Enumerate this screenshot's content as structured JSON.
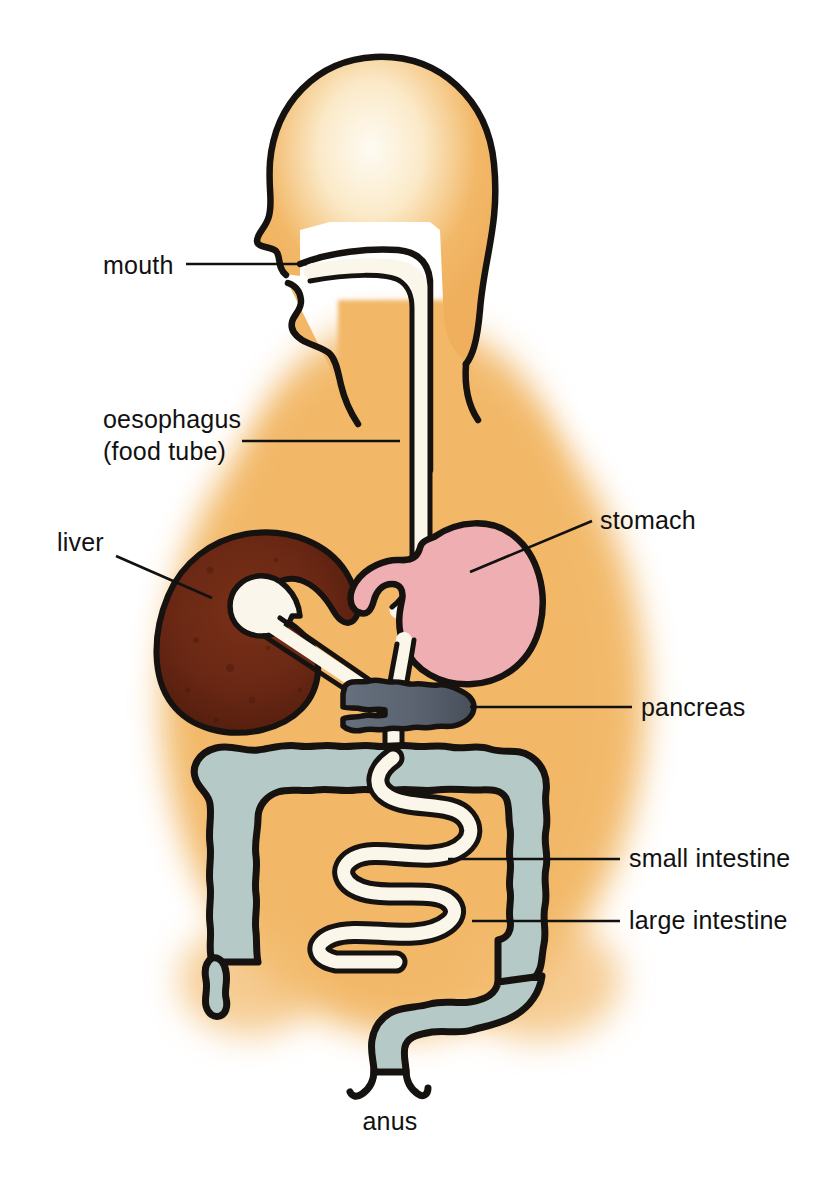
{
  "figure": {
    "background_color": "#ffffff"
  },
  "colors": {
    "body_fill": "#F2B868",
    "body_fill_edge": "#F6C77E",
    "head_highlight": "#FBF3E4",
    "outline": "#16120f",
    "liver": "#6E2A16",
    "liver_dark": "#54200f",
    "gallbladder": "#FBF6EC",
    "stomach": "#EFAEB1",
    "pancreas": "#5D6674",
    "pancreas_dark": "#4A525E",
    "large_intestine": "#B5CAC6",
    "small_intestine": "#FBF6EA",
    "tube": "#FBF6EA",
    "label_text": "#111111",
    "leader_line": "#111111"
  },
  "labels": [
    {
      "id": "mouth",
      "text": "mouth",
      "text_x": 103,
      "text_y": 274,
      "anchor": "start",
      "leader": "M 186 264 L 307 264",
      "side": "left"
    },
    {
      "id": "oesophagus",
      "text": "oesophagus",
      "text_x": 103,
      "text_y": 428,
      "anchor": "start",
      "line2": "(food tube)",
      "line2_x": 103,
      "line2_y": 460,
      "leader": "M 242 441 L 392 441",
      "side": "left"
    },
    {
      "id": "liver",
      "text": "liver",
      "text_x": 57,
      "text_y": 551,
      "anchor": "start",
      "leader": "M 116 556 L 210 596",
      "side": "left"
    },
    {
      "id": "stomach",
      "text": "stomach",
      "text_x": 600,
      "text_y": 529,
      "anchor": "start",
      "leader": "M 592 521 L 471 570",
      "side": "right"
    },
    {
      "id": "pancreas",
      "text": "pancreas",
      "text_x": 641,
      "text_y": 716,
      "anchor": "start",
      "leader": "M 632 707 L 474 707",
      "side": "right"
    },
    {
      "id": "small-intestine",
      "text": "small intestine",
      "text_x": 629,
      "text_y": 867,
      "anchor": "start",
      "leader": "M 620 859 L 451 859",
      "side": "right"
    },
    {
      "id": "large-intestine",
      "text": "large intestine",
      "text_x": 629,
      "text_y": 929,
      "anchor": "start",
      "leader": "M 620 921 L 476 921",
      "side": "right"
    },
    {
      "id": "anus",
      "text": "anus",
      "text_x": 390,
      "text_y": 1130,
      "anchor": "middle",
      "leader": "",
      "side": "bottom"
    }
  ],
  "organs": [
    {
      "id": "body",
      "name": "body-silhouette",
      "label": "body"
    },
    {
      "id": "head",
      "name": "head-profile",
      "label": "head"
    },
    {
      "id": "mouth-cavity",
      "name": "mouth-cavity",
      "label": "mouth"
    },
    {
      "id": "oesophagus",
      "name": "oesophagus-tube",
      "label": "oesophagus (food tube)"
    },
    {
      "id": "liver",
      "name": "liver-organ",
      "label": "liver"
    },
    {
      "id": "gallbladder",
      "name": "gallbladder",
      "label": "gallbladder"
    },
    {
      "id": "stomach",
      "name": "stomach-organ",
      "label": "stomach"
    },
    {
      "id": "pancreas",
      "name": "pancreas-organ",
      "label": "pancreas"
    },
    {
      "id": "small-intestine",
      "name": "small-intestine-organ",
      "label": "small intestine"
    },
    {
      "id": "large-intestine",
      "name": "large-intestine-organ",
      "label": "large intestine"
    },
    {
      "id": "appendix",
      "name": "appendix",
      "label": "appendix"
    },
    {
      "id": "rectum",
      "name": "rectum-anus",
      "label": "anus"
    }
  ]
}
